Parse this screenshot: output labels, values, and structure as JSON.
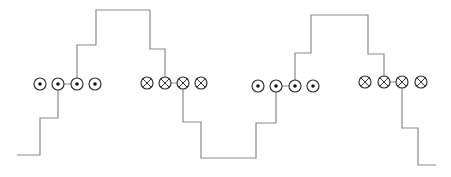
{
  "diagram": {
    "colors": {
      "line": "#8a8a8a",
      "conductor_stroke": "#333333",
      "dot": "#111111",
      "background": "#ffffff"
    },
    "conductor_radius": 6,
    "waveform": [
      [
        17,
        155
      ],
      [
        40,
        155
      ],
      [
        40,
        118
      ],
      [
        58,
        118
      ],
      [
        58,
        84
      ],
      [
        58,
        84
      ],
      [
        77,
        84
      ],
      [
        77,
        45
      ],
      [
        96,
        45
      ],
      [
        96,
        10
      ],
      [
        150,
        10
      ],
      [
        150,
        49
      ],
      [
        165,
        49
      ],
      [
        165,
        83
      ],
      [
        165,
        83
      ],
      [
        183,
        83
      ],
      [
        183,
        122
      ],
      [
        201,
        122
      ],
      [
        201,
        158
      ],
      [
        256,
        158
      ],
      [
        256,
        123
      ],
      [
        276,
        123
      ],
      [
        276,
        86
      ],
      [
        276,
        86
      ],
      [
        295,
        86
      ],
      [
        295,
        53
      ],
      [
        311,
        53
      ],
      [
        311,
        15
      ],
      [
        368,
        15
      ],
      [
        368,
        54
      ],
      [
        384,
        54
      ],
      [
        384,
        82
      ],
      [
        384,
        82
      ],
      [
        402,
        82
      ],
      [
        402,
        128
      ],
      [
        418,
        128
      ],
      [
        418,
        165
      ],
      [
        436,
        165
      ]
    ],
    "conductor_groups": [
      {
        "type": "dot",
        "label": "current out of page",
        "cy": 84,
        "cx": [
          40,
          58,
          77,
          95
        ]
      },
      {
        "type": "cross",
        "label": "current into page",
        "cy": 83,
        "cx": [
          147,
          165,
          183,
          201
        ]
      },
      {
        "type": "dot",
        "label": "current out of page",
        "cy": 86,
        "cx": [
          258,
          276,
          295,
          313
        ]
      },
      {
        "type": "cross",
        "label": "current into page",
        "cy": 82,
        "cx": [
          365,
          384,
          402,
          421
        ]
      }
    ]
  }
}
